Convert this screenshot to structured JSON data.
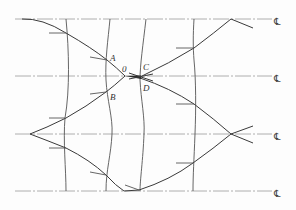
{
  "diagram": {
    "type": "characteristic-line / wave-interaction sketch",
    "point_labels": {
      "A": "A",
      "B": "B",
      "C": "C",
      "D": "D",
      "O": "0"
    },
    "centerlines": [
      {
        "symbol": "℄",
        "y": 19
      },
      {
        "symbol": "℄",
        "y": 76
      },
      {
        "symbol": "℄",
        "y": 134
      },
      {
        "symbol": "℄",
        "y": 191
      }
    ],
    "colors": {
      "line": "#3a3a3a",
      "centerline": "#9a9a9a",
      "background": "#fdfdfd"
    }
  }
}
